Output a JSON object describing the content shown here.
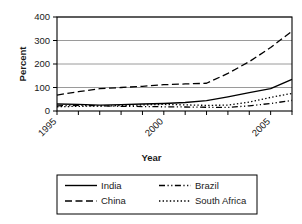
{
  "chart_data": {
    "type": "line",
    "title": "",
    "xlabel": "Year",
    "ylabel": "Percent",
    "xlim": [
      1995,
      2006
    ],
    "ylim": [
      0,
      400
    ],
    "yticks": [
      0,
      100,
      200,
      300,
      400
    ],
    "ytick_labels": [
      "0",
      "100",
      "200",
      "300",
      "400"
    ],
    "xticks": [
      1995,
      1996,
      1997,
      1998,
      1999,
      2000,
      2001,
      2002,
      2003,
      2004,
      2005,
      2006
    ],
    "xtick_labels": [
      "1995",
      "",
      "",
      "",
      "",
      "2000",
      "",
      "",
      "",
      "",
      "2005",
      ""
    ],
    "xtick_label_rotation": -45,
    "grid": "horizontal",
    "legend_position": "below",
    "x": [
      1995,
      1996,
      1997,
      1998,
      1999,
      2000,
      2001,
      2002,
      2003,
      2004,
      2005,
      2006
    ],
    "series": [
      {
        "name": "India",
        "style": "solid",
        "values": [
          30,
          28,
          25,
          27,
          30,
          32,
          36,
          44,
          60,
          78,
          95,
          135
        ]
      },
      {
        "name": "China",
        "style": "dashed",
        "values": [
          68,
          82,
          95,
          100,
          105,
          112,
          115,
          118,
          160,
          210,
          270,
          340
        ]
      },
      {
        "name": "Brazil",
        "style": "dash-dot-dot",
        "values": [
          22,
          24,
          22,
          20,
          19,
          18,
          17,
          16,
          15,
          22,
          32,
          45
        ]
      },
      {
        "name": "South Africa",
        "style": "dotted",
        "values": [
          18,
          20,
          21,
          23,
          26,
          28,
          26,
          24,
          25,
          38,
          58,
          75
        ]
      }
    ]
  },
  "axis": {
    "ylabel": "Percent",
    "xlabel": "Year"
  },
  "legend": {
    "entries": [
      {
        "label": "India",
        "style": "solid"
      },
      {
        "label": "Brazil",
        "style": "dash-dot-dot"
      },
      {
        "label": "China",
        "style": "dashed"
      },
      {
        "label": "South Africa",
        "style": "dotted"
      }
    ]
  },
  "colors": {
    "line": "#000000",
    "grid": "#808080",
    "frame": "#000000",
    "background": "#ffffff"
  }
}
